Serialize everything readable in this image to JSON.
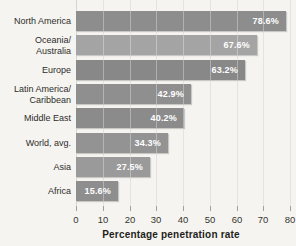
{
  "chart_data": {
    "type": "bar",
    "orientation": "horizontal",
    "title": "",
    "xlabel": "Percentage penetration rate",
    "ylabel": "",
    "xlim": [
      0,
      80
    ],
    "x_ticks": [
      0,
      10,
      20,
      30,
      40,
      50,
      60,
      70,
      80
    ],
    "grid": true,
    "legend": "none",
    "categories": [
      "North America",
      "Oceania/Australia",
      "Europe",
      "Latin America/Caribbean",
      "Middle East",
      "World, avg.",
      "Asia",
      "Africa"
    ],
    "category_lines": [
      [
        "North America"
      ],
      [
        "Oceania/",
        "Australia"
      ],
      [
        "Europe"
      ],
      [
        "Latin America/",
        "Caribbean"
      ],
      [
        "Middle East"
      ],
      [
        "World, avg."
      ],
      [
        "Asia"
      ],
      [
        "Africa"
      ]
    ],
    "values": [
      78.6,
      67.6,
      63.2,
      42.9,
      40.2,
      34.3,
      27.5,
      15.6
    ],
    "value_labels": [
      "78.6%",
      "67.6%",
      "63.2%",
      "42.9%",
      "40.2%",
      "34.3%",
      "27.5%",
      "15.6%"
    ],
    "bar_colors": [
      "#8d8d8d",
      "#a4a4a4",
      "#888888",
      "#8f8f8f",
      "#8b8b8b",
      "#939393",
      "#9a9a9a",
      "#8e8e8e"
    ]
  },
  "colors": {
    "background": "#f5f4f1",
    "gridline": "#d7d5d1",
    "value_text": "#ffffff",
    "label_text": "#2e2d2a"
  }
}
